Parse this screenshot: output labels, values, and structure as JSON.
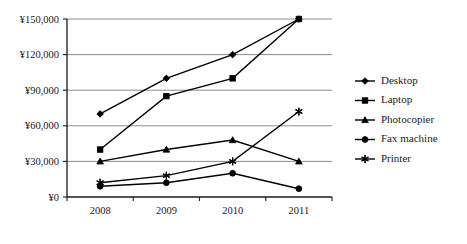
{
  "chart_data": {
    "type": "line",
    "title": "",
    "xlabel": "",
    "ylabel": "",
    "categories": [
      "2008",
      "2009",
      "2010",
      "2011"
    ],
    "ylim": [
      0,
      150000
    ],
    "ytick_values": [
      0,
      30000,
      60000,
      90000,
      120000,
      150000
    ],
    "ytick_labels": [
      "¥0",
      "¥30,000",
      "¥60,000",
      "¥90,000",
      "¥120,000",
      "¥150,000"
    ],
    "grid": true,
    "legend_position": "right",
    "currency_symbol": "¥",
    "series": [
      {
        "name": "Desktop",
        "marker": "diamond",
        "values": [
          70000,
          100000,
          120000,
          150000
        ]
      },
      {
        "name": "Laptop",
        "marker": "square",
        "values": [
          40000,
          85000,
          100000,
          150000
        ]
      },
      {
        "name": "Photocopier",
        "marker": "triangle",
        "values": [
          30000,
          40000,
          48000,
          30000
        ]
      },
      {
        "name": "Fax machine",
        "marker": "circle",
        "values": [
          9000,
          12000,
          20000,
          7000
        ]
      },
      {
        "name": "Printer",
        "marker": "asterisk",
        "values": [
          12000,
          18000,
          30000,
          72000
        ]
      }
    ]
  },
  "legend": {
    "items": [
      {
        "label": "Desktop"
      },
      {
        "label": "Laptop"
      },
      {
        "label": "Photocopier"
      },
      {
        "label": "Fax machine"
      },
      {
        "label": "Printer"
      }
    ]
  },
  "colors": {
    "series": "#000000",
    "gridline": "#8c8c8c",
    "axis": "#1a1a1a",
    "background": "#ffffff"
  }
}
